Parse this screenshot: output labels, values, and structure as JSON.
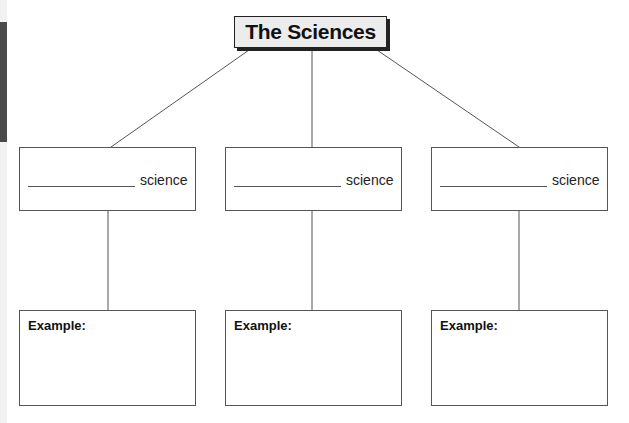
{
  "title": "The Sciences",
  "branches": [
    {
      "blank": "",
      "suffix": "science",
      "example_label": "Example:"
    },
    {
      "blank": "",
      "suffix": "science",
      "example_label": "Example:"
    },
    {
      "blank": "",
      "suffix": "science",
      "example_label": "Example:"
    }
  ],
  "colors": {
    "title_bg": "#ececec",
    "border": "#222222",
    "side_tab": "#4a4a4a"
  }
}
